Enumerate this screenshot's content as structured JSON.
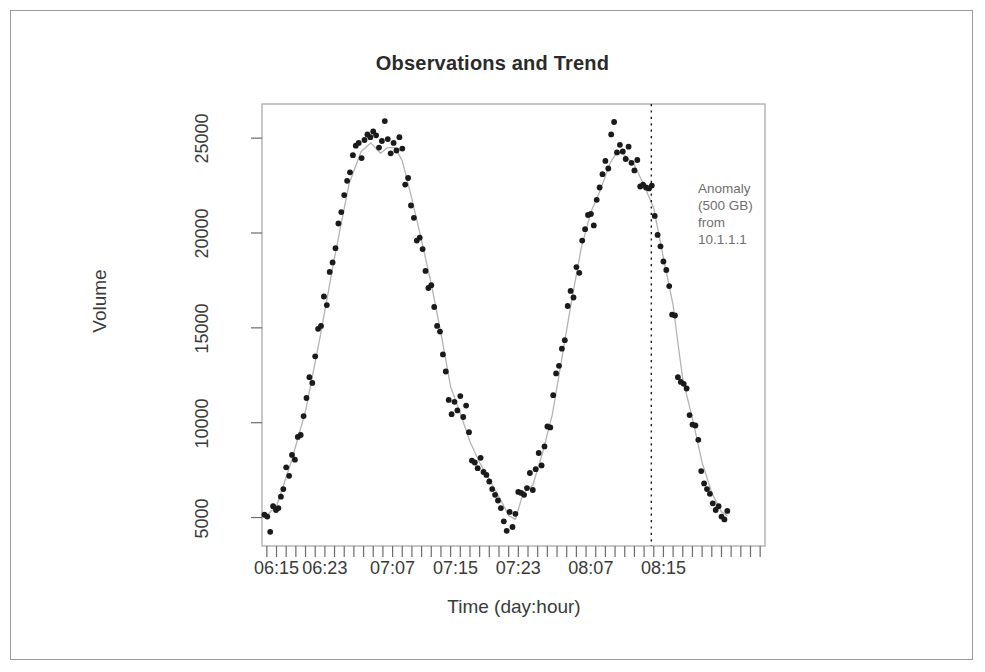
{
  "chart_data": {
    "type": "scatter",
    "title": "Observations and Trend",
    "xlabel": "Time (day:hour)",
    "ylabel": "Volume",
    "grid": false,
    "legend": "none",
    "xlim": [
      0,
      104
    ],
    "ylim": [
      3500,
      26800
    ],
    "x_tick_labels": [
      "06:15",
      "06:23",
      "07:07",
      "07:15",
      "07:23",
      "08:07",
      "08:15"
    ],
    "x_tick_positions": [
      3,
      13,
      27,
      40,
      53,
      68,
      83
    ],
    "y_tick_labels": [
      "5000",
      "10000",
      "15000",
      "20000",
      "25000"
    ],
    "y_tick_values": [
      5000,
      10000,
      15000,
      20000,
      25000
    ],
    "minor_tick_count": 52,
    "series": [
      {
        "name": "Observations",
        "type": "scatter",
        "marker": "filled-circle",
        "color": "#1a1a1a",
        "points": [
          [
            0.5,
            5150
          ],
          [
            1.1,
            5050
          ],
          [
            1.7,
            4250
          ],
          [
            2.3,
            5600
          ],
          [
            2.9,
            5400
          ],
          [
            3.4,
            5500
          ],
          [
            3.9,
            6100
          ],
          [
            4.4,
            6500
          ],
          [
            5.0,
            7650
          ],
          [
            5.6,
            7200
          ],
          [
            6.2,
            8300
          ],
          [
            6.8,
            8050
          ],
          [
            7.4,
            9250
          ],
          [
            8.0,
            9350
          ],
          [
            8.6,
            10350
          ],
          [
            9.2,
            11300
          ],
          [
            9.8,
            12400
          ],
          [
            10.4,
            12100
          ],
          [
            11.0,
            13500
          ],
          [
            11.6,
            14950
          ],
          [
            12.2,
            15100
          ],
          [
            12.8,
            16650
          ],
          [
            13.4,
            16200
          ],
          [
            14.0,
            17950
          ],
          [
            14.6,
            18450
          ],
          [
            15.2,
            19200
          ],
          [
            15.8,
            20500
          ],
          [
            16.4,
            21100
          ],
          [
            17.0,
            22000
          ],
          [
            17.6,
            22750
          ],
          [
            18.2,
            23200
          ],
          [
            18.8,
            24100
          ],
          [
            19.4,
            24600
          ],
          [
            20.0,
            24750
          ],
          [
            20.6,
            23950
          ],
          [
            21.2,
            24900
          ],
          [
            21.8,
            25200
          ],
          [
            22.4,
            25050
          ],
          [
            23.0,
            25350
          ],
          [
            23.6,
            25150
          ],
          [
            24.2,
            24500
          ],
          [
            24.8,
            24850
          ],
          [
            25.4,
            25900
          ],
          [
            26.0,
            24950
          ],
          [
            26.6,
            24200
          ],
          [
            27.2,
            24750
          ],
          [
            27.8,
            24350
          ],
          [
            28.4,
            25050
          ],
          [
            29.0,
            24450
          ],
          [
            29.6,
            22550
          ],
          [
            30.2,
            22900
          ],
          [
            30.8,
            21450
          ],
          [
            31.4,
            20800
          ],
          [
            32.0,
            19600
          ],
          [
            32.6,
            19750
          ],
          [
            33.2,
            19150
          ],
          [
            33.8,
            18000
          ],
          [
            34.4,
            17100
          ],
          [
            35.0,
            17250
          ],
          [
            35.6,
            16100
          ],
          [
            36.2,
            15100
          ],
          [
            36.8,
            14800
          ],
          [
            37.4,
            13600
          ],
          [
            38.0,
            12700
          ],
          [
            38.6,
            11200
          ],
          [
            39.2,
            10450
          ],
          [
            39.8,
            11100
          ],
          [
            40.4,
            10650
          ],
          [
            41.0,
            11400
          ],
          [
            41.6,
            10300
          ],
          [
            42.2,
            10900
          ],
          [
            42.8,
            9500
          ],
          [
            43.4,
            8000
          ],
          [
            44.0,
            7900
          ],
          [
            44.6,
            7600
          ],
          [
            45.2,
            8150
          ],
          [
            45.8,
            7400
          ],
          [
            46.4,
            7250
          ],
          [
            47.0,
            6900
          ],
          [
            47.6,
            6500
          ],
          [
            48.2,
            6200
          ],
          [
            48.8,
            5900
          ],
          [
            49.4,
            5500
          ],
          [
            50.0,
            4800
          ],
          [
            50.6,
            4300
          ],
          [
            51.2,
            5300
          ],
          [
            51.8,
            4500
          ],
          [
            52.4,
            5200
          ],
          [
            53.0,
            6350
          ],
          [
            53.6,
            6300
          ],
          [
            54.2,
            6200
          ],
          [
            54.8,
            6550
          ],
          [
            55.4,
            7350
          ],
          [
            56.0,
            6450
          ],
          [
            56.6,
            7550
          ],
          [
            57.2,
            8400
          ],
          [
            57.8,
            7750
          ],
          [
            58.4,
            8750
          ],
          [
            59.0,
            9800
          ],
          [
            59.6,
            9750
          ],
          [
            60.2,
            11450
          ],
          [
            60.8,
            12600
          ],
          [
            61.4,
            13000
          ],
          [
            62.0,
            13900
          ],
          [
            62.6,
            14350
          ],
          [
            63.2,
            16150
          ],
          [
            63.8,
            16950
          ],
          [
            64.4,
            16600
          ],
          [
            65.0,
            18200
          ],
          [
            65.6,
            17900
          ],
          [
            66.2,
            19600
          ],
          [
            66.8,
            20200
          ],
          [
            67.4,
            20950
          ],
          [
            68.0,
            21000
          ],
          [
            68.6,
            20400
          ],
          [
            69.2,
            21750
          ],
          [
            69.8,
            22400
          ],
          [
            70.4,
            23100
          ],
          [
            71.0,
            23800
          ],
          [
            71.6,
            23400
          ],
          [
            72.2,
            25200
          ],
          [
            72.8,
            25850
          ],
          [
            73.4,
            24250
          ],
          [
            74.0,
            24650
          ],
          [
            74.6,
            24300
          ],
          [
            75.2,
            23900
          ],
          [
            75.8,
            24550
          ],
          [
            76.4,
            23700
          ],
          [
            77.0,
            23300
          ],
          [
            77.6,
            23850
          ],
          [
            78.2,
            22450
          ],
          [
            78.8,
            22550
          ],
          [
            79.4,
            22400
          ],
          [
            80.0,
            22350
          ],
          [
            80.6,
            22500
          ],
          [
            81.2,
            20900
          ],
          [
            81.8,
            19900
          ],
          [
            82.4,
            19300
          ],
          [
            83.0,
            18500
          ],
          [
            83.6,
            18050
          ],
          [
            84.2,
            17200
          ],
          [
            84.8,
            15700
          ],
          [
            85.4,
            15650
          ],
          [
            86.0,
            12400
          ],
          [
            86.6,
            12150
          ],
          [
            87.2,
            12050
          ],
          [
            87.8,
            11800
          ],
          [
            88.4,
            10400
          ],
          [
            89.0,
            9900
          ],
          [
            89.6,
            9850
          ],
          [
            90.2,
            9100
          ],
          [
            90.8,
            7450
          ],
          [
            91.4,
            6800
          ],
          [
            92.0,
            6500
          ],
          [
            92.6,
            6250
          ],
          [
            93.2,
            5750
          ],
          [
            93.8,
            5400
          ],
          [
            94.4,
            5600
          ],
          [
            95.0,
            5050
          ],
          [
            95.6,
            4900
          ],
          [
            96.2,
            5350
          ]
        ]
      },
      {
        "name": "Trend",
        "type": "line",
        "color": "#b4b4b4",
        "points": [
          [
            0.5,
            5000
          ],
          [
            3.0,
            5600
          ],
          [
            6.0,
            7900
          ],
          [
            9.0,
            10600
          ],
          [
            12.0,
            14500
          ],
          [
            15.0,
            18700
          ],
          [
            18.0,
            22600
          ],
          [
            20.5,
            24300
          ],
          [
            22.5,
            24750
          ],
          [
            24.5,
            24200
          ],
          [
            26.0,
            24500
          ],
          [
            27.5,
            24500
          ],
          [
            29.0,
            23800
          ],
          [
            31.0,
            21800
          ],
          [
            33.0,
            19600
          ],
          [
            35.0,
            17300
          ],
          [
            37.0,
            14700
          ],
          [
            39.0,
            11900
          ],
          [
            41.0,
            10500
          ],
          [
            43.0,
            9000
          ],
          [
            45.0,
            7900
          ],
          [
            47.0,
            7000
          ],
          [
            49.0,
            6100
          ],
          [
            51.0,
            5100
          ],
          [
            52.4,
            4900
          ],
          [
            54.0,
            6300
          ],
          [
            56.0,
            6700
          ],
          [
            58.0,
            8400
          ],
          [
            60.0,
            10400
          ],
          [
            62.0,
            13400
          ],
          [
            64.0,
            16400
          ],
          [
            66.0,
            19200
          ],
          [
            68.0,
            21100
          ],
          [
            70.0,
            22300
          ],
          [
            72.0,
            23700
          ],
          [
            73.5,
            24300
          ],
          [
            75.0,
            24100
          ],
          [
            77.0,
            23600
          ],
          [
            79.0,
            22500
          ],
          [
            81.0,
            21300
          ],
          [
            83.0,
            18700
          ],
          [
            85.0,
            16200
          ],
          [
            86.0,
            14200
          ],
          [
            87.0,
            12300
          ],
          [
            89.0,
            10200
          ],
          [
            91.0,
            7900
          ],
          [
            93.0,
            6300
          ],
          [
            95.0,
            5300
          ],
          [
            96.2,
            5100
          ]
        ]
      }
    ],
    "annotations": [
      {
        "type": "vline",
        "x": 80.5,
        "style": "dotted",
        "color": "#1a1a1a",
        "label_lines": [
          "Anomaly",
          "(500 GB)",
          "from",
          "10.1.1.1"
        ]
      }
    ]
  },
  "annotation_text": {
    "line1": "Anomaly",
    "line2": "(500 GB)",
    "line3": "from",
    "line4": "10.1.1.1"
  }
}
